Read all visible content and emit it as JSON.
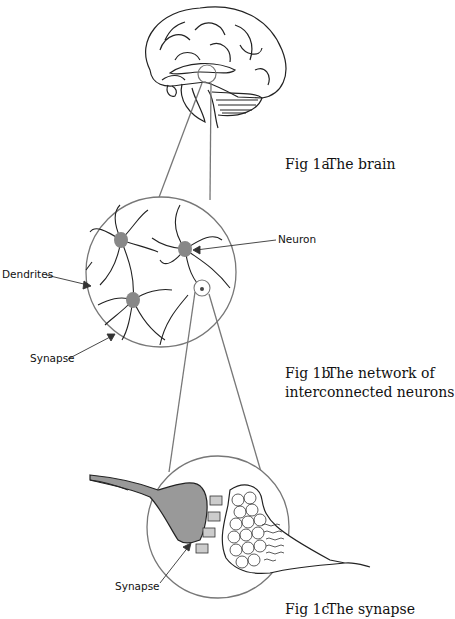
{
  "figure": {
    "panels": [
      {
        "id": "1a",
        "number": "Fig 1a",
        "title": "The brain",
        "title_line2": ""
      },
      {
        "id": "1b",
        "number": "Fig 1b",
        "title": "The network of",
        "title_line2": "interconnected neurons"
      },
      {
        "id": "1c",
        "number": "Fig 1c",
        "title": "The synapse",
        "title_line2": ""
      }
    ],
    "labels": {
      "neuron": "Neuron",
      "dendrites": "Dendrites",
      "synapse_network": "Synapse",
      "synapse_detail": "Synapse"
    },
    "colors": {
      "line": "#222222",
      "connector": "#777777",
      "cell_body": "#888888",
      "axon_terminal": "#999999"
    }
  }
}
